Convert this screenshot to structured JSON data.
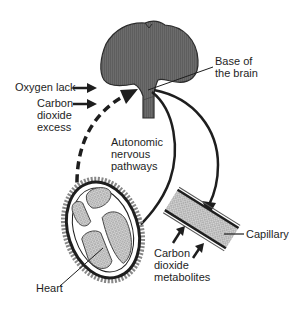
{
  "diagram": {
    "type": "physiology-schematic",
    "labels": {
      "oxygen_lack": "Oxygen lack",
      "co2_excess_1": "Carbon",
      "co2_excess_2": "dioxide",
      "co2_excess_3": "excess",
      "base_brain_1": "Base of",
      "base_brain_2": "the brain",
      "autonomic_1": "Autonomic",
      "autonomic_2": "nervous",
      "autonomic_3": "pathways",
      "capillary": "Capillary",
      "metabolites_1": "Carbon",
      "metabolites_2": "dioxide",
      "metabolites_3": "metabolites",
      "heart": "Heart"
    },
    "nodes": [
      {
        "id": "brain",
        "name": "Brain"
      },
      {
        "id": "heart",
        "name": "Heart"
      },
      {
        "id": "capillary",
        "name": "Capillary"
      }
    ],
    "edges": [
      {
        "from": "heart",
        "to": "brain",
        "style": "dashed"
      },
      {
        "from": "brain",
        "to": "heart",
        "style": "solid",
        "label": "Autonomic nervous pathways"
      },
      {
        "from": "brain",
        "to": "capillary",
        "style": "solid"
      }
    ],
    "colors": {
      "ink": "#1e1e1e",
      "brain_fill": "#6a6a6a",
      "stipple": "#b8b8b8",
      "background": "#ffffff"
    }
  }
}
